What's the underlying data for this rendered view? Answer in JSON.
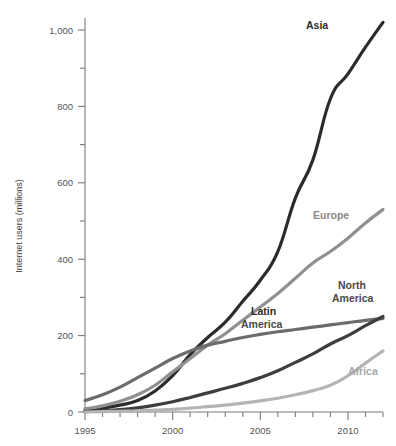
{
  "chart_data": {
    "type": "line",
    "title": "",
    "xlabel": "",
    "ylabel": "Internet users (millions)",
    "xlim": [
      1995,
      2012
    ],
    "ylim": [
      0,
      1060
    ],
    "grid": false,
    "legend_position": "inline-line-end",
    "y_ticks_major": [
      "0",
      "200",
      "400",
      "600",
      "800",
      "1,000"
    ],
    "y_tick_values_major": [
      0,
      200,
      400,
      600,
      800,
      1000
    ],
    "y_tick_values_minor": [
      100,
      300,
      500,
      700,
      900
    ],
    "x_ticks_major": [
      "1995",
      "2000",
      "2005",
      "2010"
    ],
    "x_tick_values_major": [
      1995,
      2000,
      2005,
      2010
    ],
    "x": [
      1995,
      1996,
      1997,
      1998,
      1999,
      2000,
      2001,
      2002,
      2003,
      2004,
      2005,
      2006,
      2007,
      2008,
      2009,
      2010,
      2011,
      2012
    ],
    "series": [
      {
        "name": "Asia",
        "color": "#2b2b2b",
        "label_color": "#2b2b2b",
        "width": 3.2,
        "values": [
          5,
          10,
          18,
          30,
          55,
          95,
          150,
          195,
          235,
          290,
          345,
          420,
          560,
          660,
          820,
          885,
          955,
          1020
        ]
      },
      {
        "name": "Europe",
        "color": "#909090",
        "label_color": "#8a8a8a",
        "width": 3.2,
        "values": [
          8,
          16,
          28,
          45,
          70,
          105,
          140,
          175,
          205,
          240,
          275,
          310,
          350,
          390,
          420,
          455,
          495,
          530
        ]
      },
      {
        "name": "North America",
        "color": "#6b6b6b",
        "label_color": "#4a4a4a",
        "width": 3.2,
        "values": [
          30,
          45,
          65,
          90,
          115,
          140,
          160,
          175,
          185,
          195,
          203,
          210,
          216,
          222,
          228,
          234,
          240,
          245
        ]
      },
      {
        "name": "Latin America",
        "color": "#3d3d3d",
        "label_color": "#2b2b2b",
        "width": 3.2,
        "values": [
          1,
          3,
          6,
          11,
          18,
          27,
          38,
          50,
          62,
          75,
          90,
          108,
          130,
          152,
          178,
          200,
          226,
          250
        ]
      },
      {
        "name": "Africa",
        "color": "#b4b4b4",
        "label_color": "#a8a8a8",
        "width": 3.2,
        "values": [
          0,
          1,
          2,
          3,
          5,
          7,
          10,
          14,
          18,
          23,
          29,
          36,
          45,
          56,
          70,
          95,
          128,
          160
        ]
      }
    ],
    "annotations": [
      {
        "text": "Asia",
        "x_px": 306,
        "y_px": 29
      },
      {
        "text": "Europe",
        "x_px": 313,
        "y_px": 219
      },
      {
        "text": "North",
        "x_px": 338,
        "y_px": 289
      },
      {
        "text": "America",
        "x_px": 332,
        "y_px": 302
      },
      {
        "text": "Latin",
        "x_px": 251,
        "y_px": 315
      },
      {
        "text": "America",
        "x_px": 241,
        "y_px": 328
      },
      {
        "text": "Africa",
        "x_px": 348,
        "y_px": 375
      }
    ]
  }
}
